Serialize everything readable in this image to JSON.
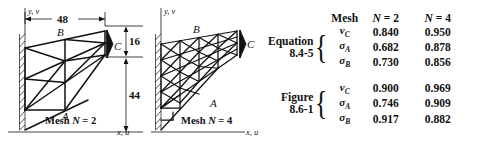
{
  "figures": [
    {
      "id": "mesh-n2",
      "caption_prefix": "Mesh ",
      "caption_var": "N",
      "caption_eq": " = ",
      "caption_value": "2",
      "axis_y_label": "y, v",
      "axis_x_label": "x, u",
      "dimensions": {
        "span": "48",
        "depth_tip": "16",
        "depth_root_offset": "44"
      },
      "node_labels": {
        "a": "A",
        "b": "B",
        "c": "C"
      }
    },
    {
      "id": "mesh-n4",
      "caption_prefix": "Mesh ",
      "caption_var": "N",
      "caption_eq": " = ",
      "caption_value": "4",
      "axis_y_label": "y, v",
      "axis_x_label": "x, u",
      "node_labels": {
        "a": "A",
        "b": "B",
        "c": "C"
      }
    }
  ],
  "table": {
    "header": {
      "mesh": "Mesh",
      "col1_var": "N",
      "col1_eq": " = ",
      "col1_value": "2",
      "col2_var": "N",
      "col2_eq": " = ",
      "col2_value": "4"
    },
    "groups": [
      {
        "label_line1": "Equation",
        "label_line2": "8.4-5",
        "brace": "{",
        "rows": [
          {
            "symbol": "v",
            "subscript": "C",
            "n2": "0.840",
            "n4": "0.950"
          },
          {
            "symbol": "σ",
            "subscript": "A",
            "n2": "0.682",
            "n4": "0.878"
          },
          {
            "symbol": "σ",
            "subscript": "B",
            "n2": "0.730",
            "n4": "0.856"
          }
        ]
      },
      {
        "label_line1": "Figure",
        "label_line2": "8.6-1",
        "brace": "{",
        "rows": [
          {
            "symbol": "v",
            "subscript": "C",
            "n2": "0.900",
            "n4": "0.969"
          },
          {
            "symbol": "σ",
            "subscript": "A",
            "n2": "0.746",
            "n4": "0.909"
          },
          {
            "symbol": "σ",
            "subscript": "B",
            "n2": "0.917",
            "n4": "0.882"
          }
        ]
      }
    ]
  },
  "colors": {
    "ink": "#1a1a1a",
    "line": "#111111",
    "background": "#ffffff"
  }
}
